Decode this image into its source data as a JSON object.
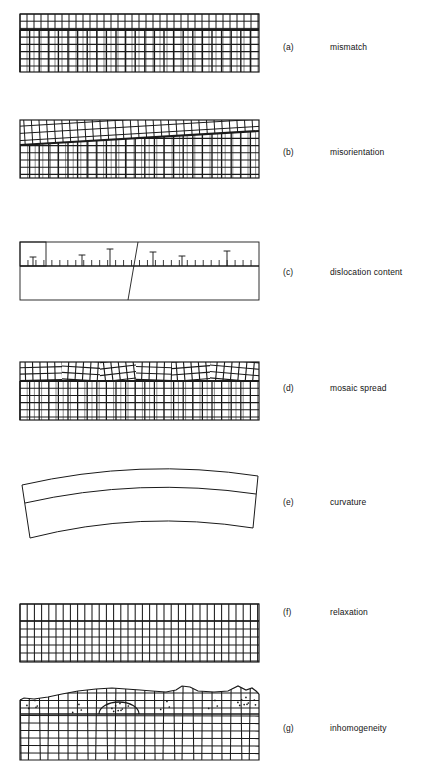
{
  "figure": {
    "width": 446,
    "height": 772,
    "background": "#ffffff",
    "ink": "#1a1a1a",
    "panel_left": 20,
    "panel_right": 259,
    "panel_width": 239
  },
  "panels": [
    {
      "id": "a",
      "tag": "(a)",
      "caption": "mismatch",
      "tag_x": 283,
      "caption_x": 330,
      "label_y": 47,
      "box": {
        "x": 20,
        "y": 14,
        "w": 239,
        "h": 58
      },
      "interface_y": 30,
      "grid": {
        "top_cell_w": 7.0,
        "bottom_cell_w": 9.6,
        "row_h": 7.2,
        "top_rows": 2,
        "bottom_rows": 6
      }
    },
    {
      "id": "b",
      "tag": "(b)",
      "caption": "misorientation",
      "tag_x": 283,
      "caption_x": 330,
      "label_y": 152,
      "box": {
        "x": 20,
        "y": 120,
        "w": 239,
        "h": 58
      },
      "interface_left_y": 145,
      "interface_right_y": 131,
      "tilt_deg": -3.4,
      "grid": {
        "top_cell_w": 7.6,
        "bottom_cell_w": 9.6,
        "row_h": 7.2
      }
    },
    {
      "id": "c",
      "tag": "(c)",
      "caption": "dislocation content",
      "tag_x": 283,
      "caption_x": 330,
      "label_y": 272,
      "box": {
        "x": 20,
        "y": 242,
        "w": 239,
        "h": 58
      },
      "interface_y": 266,
      "corner_box": {
        "x": 20,
        "y": 242,
        "w": 26,
        "h": 24
      },
      "grain_boundary": {
        "x1": 138,
        "y1": 242,
        "x2": 128,
        "y2": 300
      },
      "tick_len": 6,
      "tick_count": 30,
      "dislocations": [
        {
          "x": 33,
          "stem": 9
        },
        {
          "x": 82,
          "stem": 11
        },
        {
          "x": 110,
          "stem": 17
        },
        {
          "x": 153,
          "stem": 14
        },
        {
          "x": 182,
          "stem": 10
        },
        {
          "x": 227,
          "stem": 15
        }
      ]
    },
    {
      "id": "d",
      "tag": "(d)",
      "caption": "mosaic spread",
      "tag_x": 283,
      "caption_x": 330,
      "label_y": 388,
      "box": {
        "x": 20,
        "y": 362,
        "w": 239,
        "h": 58
      },
      "interface_y": 381,
      "mosaic_blocks": [
        {
          "x0": 20,
          "x1": 62,
          "angle": -1.5
        },
        {
          "x0": 62,
          "x1": 100,
          "angle": 3.5
        },
        {
          "x0": 100,
          "x1": 136,
          "angle": -6.5
        },
        {
          "x0": 136,
          "x1": 172,
          "angle": 2.0
        },
        {
          "x0": 172,
          "x1": 210,
          "angle": -4.5
        },
        {
          "x0": 210,
          "x1": 259,
          "angle": 5.0
        }
      ],
      "grid": {
        "cell_w": 9.6,
        "row_h": 7.2
      }
    },
    {
      "id": "e",
      "tag": "(e)",
      "caption": "curvature",
      "tag_x": 283,
      "caption_x": 330,
      "label_y": 502,
      "arc": {
        "left_x": 22,
        "right_x": 258,
        "top_rise": 18,
        "band_top_y": 476,
        "band_mid_y": 494,
        "band_bot_y": 528,
        "end_tilt": 9
      }
    },
    {
      "id": "f",
      "tag": "(f)",
      "caption": "relaxation",
      "tag_x": 283,
      "caption_x": 330,
      "label_y": 612,
      "box": {
        "x": 20,
        "y": 604,
        "w": 239,
        "h": 58
      },
      "interface_y": 621,
      "grid": {
        "cell_w": 7.2,
        "top_row_h": 10.5,
        "row_h": 8.0,
        "bottom_rows": 5
      }
    },
    {
      "id": "g",
      "tag": "(g)",
      "caption": "inhomogeneity",
      "tag_x": 283,
      "caption_x": 330,
      "label_y": 728,
      "box": {
        "x": 20,
        "y": 692,
        "w": 239,
        "h": 68
      },
      "interface_y": 714,
      "surface_profile": "wavy irregular top with bumps and a jagged right edge",
      "inclusion_dome": {
        "cx": 119,
        "cy": 714,
        "rx": 20,
        "ry": 11
      },
      "defect_clusters": [
        {
          "cx": 34,
          "cy": 706,
          "n": 5
        },
        {
          "cx": 78,
          "cy": 710,
          "n": 3
        },
        {
          "cx": 119,
          "cy": 709,
          "n": 8
        },
        {
          "cx": 166,
          "cy": 707,
          "n": 3
        },
        {
          "cx": 214,
          "cy": 706,
          "n": 3
        },
        {
          "cx": 245,
          "cy": 703,
          "n": 9
        }
      ],
      "grid": {
        "cell_w": 9.6,
        "row_h": 7.5
      }
    }
  ]
}
